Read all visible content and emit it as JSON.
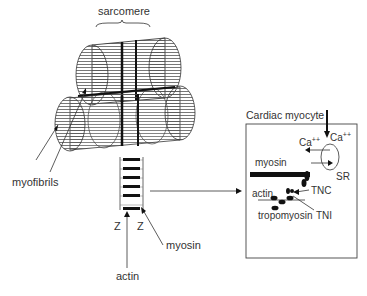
{
  "labels": {
    "sarcomere": "sarcomere",
    "myofibrils": "myofibrils",
    "z_left": "Z",
    "z_right": "Z",
    "myosin_main": "myosin",
    "actin_main": "actin"
  },
  "inset": {
    "title": "Cardiac myocyte",
    "ca_in": "Ca",
    "ca_in_sup": "++",
    "ca_sr": "Ca",
    "ca_sr_sup": "++",
    "sr": "SR",
    "myosin": "myosin",
    "actin": "actin",
    "tnc": "TNC",
    "tni": "TNI",
    "tropomyosin": "tropomyosin"
  },
  "colors": {
    "ink": "#111111",
    "text": "#333333",
    "hatch": "#555555",
    "box": "#444444"
  }
}
